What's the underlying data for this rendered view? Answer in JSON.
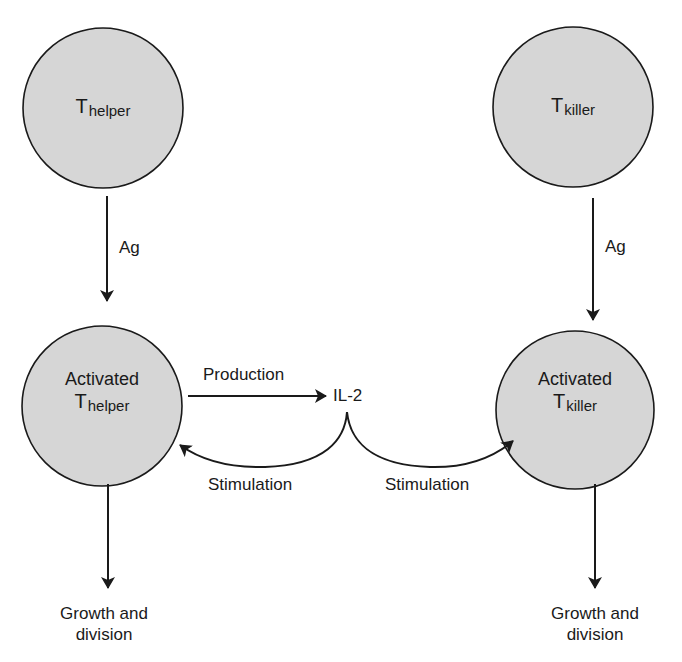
{
  "diagram": {
    "colors": {
      "cell_fill": "#d6d6d6",
      "stroke": "#1a1a1a",
      "background": "#ffffff"
    },
    "nodes": {
      "t_helper": {
        "main": "T",
        "sub": "helper"
      },
      "t_killer": {
        "main": "T",
        "sub": "killer"
      },
      "activated_t_helper": {
        "prefix": "Activated",
        "main": "T",
        "sub": "helper"
      },
      "activated_t_killer": {
        "prefix": "Activated",
        "main": "T",
        "sub": "killer"
      },
      "il2": {
        "label": "IL-2"
      },
      "growth_left": {
        "line1": "Growth and",
        "line2": "division"
      },
      "growth_right": {
        "line1": "Growth and",
        "line2": "division"
      }
    },
    "edges": {
      "ag_left": "Ag",
      "ag_right": "Ag",
      "production": "Production",
      "stimulation_left": "Stimulation",
      "stimulation_right": "Stimulation"
    }
  }
}
